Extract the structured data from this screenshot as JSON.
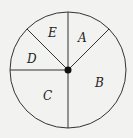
{
  "diagram": {
    "type": "spinner",
    "center": {
      "x": 68,
      "y": 70
    },
    "radius": 58,
    "stroke_color": "#333333",
    "background": "#f2f2f0",
    "sectors": [
      {
        "label": "A",
        "start_deg": 45,
        "end_deg": 90,
        "label_pos": {
          "x": 82,
          "y": 41
        }
      },
      {
        "label": "B",
        "start_deg": 270,
        "end_deg": 405,
        "label_pos": {
          "x": 99,
          "y": 86
        }
      },
      {
        "label": "C",
        "start_deg": 180,
        "end_deg": 270,
        "label_pos": {
          "x": 47,
          "y": 99
        }
      },
      {
        "label": "D",
        "start_deg": 135,
        "end_deg": 180,
        "label_pos": {
          "x": 31,
          "y": 62
        }
      },
      {
        "label": "E",
        "start_deg": 90,
        "end_deg": 135,
        "label_pos": {
          "x": 52,
          "y": 36
        }
      }
    ],
    "boundary_angles_deg": [
      45,
      90,
      135,
      180,
      270
    ]
  }
}
